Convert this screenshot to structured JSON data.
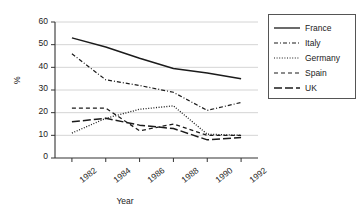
{
  "chart_data": {
    "type": "line",
    "title": "",
    "xlabel": "Year",
    "ylabel": "%",
    "x": [
      1982,
      1984,
      1986,
      1988,
      1990,
      1992
    ],
    "xtick_labels": [
      "1982",
      "1984",
      "1986",
      "1988",
      "1990",
      "1992"
    ],
    "ytick_labels": [
      "0",
      "10",
      "20",
      "30",
      "40",
      "50",
      "60"
    ],
    "yticks": [
      0,
      10,
      20,
      30,
      40,
      50,
      60
    ],
    "ylim": [
      0,
      60
    ],
    "xlim": [
      1981,
      1993
    ],
    "grid": "horizontal",
    "legend_position": "right-outside",
    "series": [
      {
        "name": "France",
        "style": "solid",
        "color": "#1b1b1b",
        "values": [
          53,
          49,
          44,
          39.5,
          37.5,
          35
        ]
      },
      {
        "name": "Italy",
        "style": "dash-dot",
        "color": "#1b1b1b",
        "values": [
          46,
          34.5,
          32,
          29,
          21,
          24.5
        ]
      },
      {
        "name": "Germany",
        "style": "dotted",
        "color": "#1b1b1b",
        "values": [
          11,
          17.5,
          21.5,
          23,
          10.5,
          10
        ]
      },
      {
        "name": "Spain",
        "style": "dashed",
        "color": "#1b1b1b",
        "values": [
          22,
          22,
          12,
          15,
          10,
          10
        ]
      },
      {
        "name": "UK",
        "style": "long-dash",
        "color": "#1b1b1b",
        "values": [
          16,
          17.5,
          14.5,
          13,
          8,
          9
        ]
      }
    ]
  },
  "legend": {
    "items": [
      {
        "label": "France"
      },
      {
        "label": "Italy"
      },
      {
        "label": "Germany"
      },
      {
        "label": "Spain"
      },
      {
        "label": "UK"
      }
    ]
  },
  "axes": {
    "x_title": "Year",
    "y_title": "%"
  }
}
